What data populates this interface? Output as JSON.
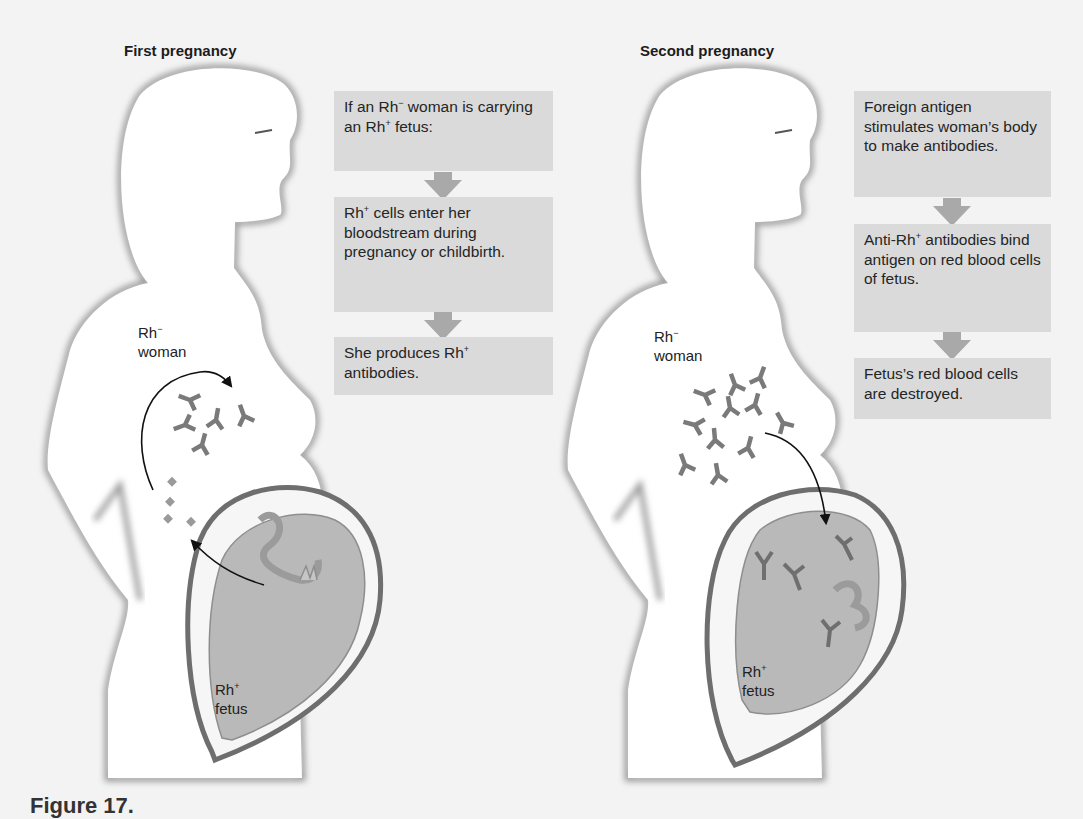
{
  "panels": [
    {
      "title": "First pregnancy",
      "woman_label": {
        "base": "Rh",
        "sup": "−",
        "line2": "woman"
      },
      "fetus_label": {
        "base": "Rh",
        "sup": "+",
        "line2": "fetus"
      },
      "steps": [
        {
          "parts": [
            "If an Rh",
            "−",
            " woman is carrying an Rh",
            "+",
            " fetus:"
          ]
        },
        {
          "parts": [
            "Rh",
            "+",
            " cells enter her bloodstream during pregnancy or childbirth."
          ]
        },
        {
          "parts": [
            "She produces Rh",
            "+",
            " antibodies."
          ]
        }
      ]
    },
    {
      "title": "Second pregnancy",
      "woman_label": {
        "base": "Rh",
        "sup": "−",
        "line2": "woman"
      },
      "fetus_label": {
        "base": "Rh",
        "sup": "+",
        "line2": "fetus"
      },
      "steps": [
        {
          "parts": [
            "Foreign antigen stimulates woman’s body to make antibodies."
          ]
        },
        {
          "parts": [
            "Anti-Rh",
            "+",
            " antibodies bind antigen on red blood cells of fetus."
          ]
        },
        {
          "parts": [
            "Fetus’s red blood cells are destroyed."
          ]
        }
      ]
    }
  ],
  "step_text": {
    "p1s1": "If an Rh− woman is carrying an Rh+ fetus:",
    "p1s2": "Rh+ cells enter her bloodstream during pregnancy or childbirth.",
    "p1s3": "She produces Rh+ antibodies.",
    "p2s1": "Foreign antigen stimulates woman’s body to make antibodies.",
    "p2s2": "Anti-Rh+ antibodies bind antigen on red blood cells of fetus.",
    "p2s3": "Fetus’s red blood cells are destroyed."
  },
  "caption": "Figure 17.",
  "colors": {
    "background": "#f3f3f3",
    "box_fill": "#dadada",
    "flow_arrow": "#a9a9a9",
    "uterus_wall": "#6e6e6e",
    "fetus_fill": "#b9b9b9",
    "antibody": "#7a7a7a",
    "outline_shadow": "#8a8a8a"
  },
  "icons": {
    "antibody": "antibody-y-icon",
    "rh_cell": "rh-cell-diamond-icon",
    "flow_arrow": "down-arrow-icon",
    "curved_arrow": "curved-arrow-icon"
  }
}
